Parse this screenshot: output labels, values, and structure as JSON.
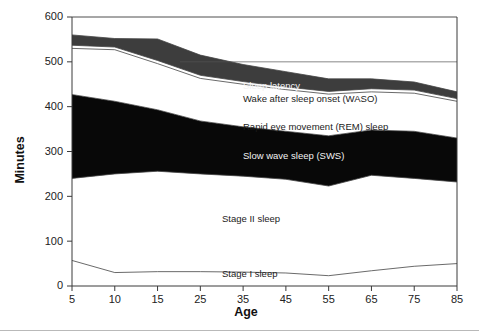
{
  "figure": {
    "background_color": "#ffffff",
    "plot_border_color": "#3a3a3a",
    "gridline_color": "#555555",
    "band_dark_color": "#3d3d3d",
    "band_black_color": "#080808",
    "band_white_color": "#ffffff",
    "line_color": "#444444"
  },
  "chart_data": {
    "type": "area",
    "title": "",
    "subtitle": "",
    "xlabel": "Age",
    "ylabel": "Minutes",
    "categories": [
      "5",
      "10",
      "15",
      "25",
      "35",
      "45",
      "55",
      "65",
      "75",
      "85"
    ],
    "x": [
      5,
      10,
      15,
      25,
      35,
      45,
      55,
      65,
      75,
      85
    ],
    "ylim": [
      0,
      600
    ],
    "yticks": [
      0,
      100,
      200,
      300,
      400,
      500,
      600
    ],
    "ytick_labels": [
      "0",
      "100",
      "200",
      "300",
      "400",
      "500",
      "600"
    ],
    "xtick_labels": [
      "5",
      "10",
      "15",
      "25",
      "35",
      "45",
      "55",
      "65",
      "75",
      "85"
    ],
    "grid": "horizontal-partial",
    "legend": "inline-annotations",
    "stacking": "bottom-to-top",
    "boundaries": {
      "stage_i_top": [
        57,
        30,
        32,
        32,
        31,
        29,
        23,
        34,
        44,
        50
      ],
      "stage_ii_top": [
        240,
        250,
        256,
        250,
        245,
        238,
        223,
        247,
        240,
        232
      ],
      "sws_top": [
        427,
        412,
        393,
        368,
        355,
        345,
        335,
        348,
        345,
        330
      ],
      "rem_top": [
        530,
        527,
        496,
        463,
        450,
        438,
        428,
        433,
        430,
        412
      ],
      "waso_top": [
        537,
        533,
        503,
        470,
        456,
        444,
        434,
        440,
        437,
        418
      ],
      "latency_top": [
        560,
        552,
        551,
        515,
        494,
        478,
        462,
        462,
        455,
        433
      ]
    },
    "series": [
      {
        "name": "Stage I sleep",
        "fill": "white",
        "values": [
          57,
          30,
          32,
          32,
          31,
          29,
          23,
          34,
          44,
          50
        ]
      },
      {
        "name": "Stage II sleep",
        "fill": "white",
        "values": [
          183,
          220,
          224,
          218,
          214,
          209,
          200,
          213,
          196,
          182
        ]
      },
      {
        "name": "Slow wave sleep (SWS)",
        "fill": "black",
        "values": [
          187,
          162,
          137,
          118,
          110,
          107,
          112,
          101,
          105,
          98
        ]
      },
      {
        "name": "Rapid eye movement (REM) sleep",
        "fill": "white",
        "values": [
          103,
          115,
          103,
          95,
          95,
          93,
          93,
          85,
          85,
          82
        ]
      },
      {
        "name": "Wake after sleep onset (WASO)",
        "fill": "white",
        "values": [
          7,
          6,
          7,
          7,
          6,
          6,
          6,
          7,
          7,
          6
        ]
      },
      {
        "name": "Sleep latency",
        "fill": "dark-gray",
        "values": [
          23,
          19,
          48,
          45,
          38,
          34,
          28,
          22,
          18,
          15
        ]
      }
    ],
    "annotations": [
      {
        "id": "sleep-latency",
        "text": "Sleep latency",
        "x": 243,
        "y": 89,
        "style": "light"
      },
      {
        "id": "waso",
        "text": "Wake after sleep onset (WASO)",
        "x": 243,
        "y": 102,
        "style": "dark"
      },
      {
        "id": "rem",
        "text": "Rapid eye movement (REM) sleep",
        "x": 243,
        "y": 130,
        "style": "dark"
      },
      {
        "id": "sws",
        "text": "Slow wave sleep (SWS)",
        "x": 243,
        "y": 159,
        "style": "light"
      },
      {
        "id": "stage-ii",
        "text": "Stage II sleep",
        "x": 222,
        "y": 222,
        "style": "dark"
      },
      {
        "id": "stage-i",
        "text": "Stage I sleep",
        "x": 222,
        "y": 277,
        "style": "dark"
      }
    ]
  }
}
